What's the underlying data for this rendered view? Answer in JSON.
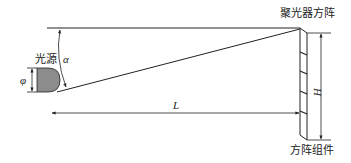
{
  "diagram": {
    "type": "optical-geometry",
    "labels": {
      "light_source": "光源",
      "concentrator_array": "聚光器方阵",
      "array_module": "方阵组件",
      "angle": "α",
      "diameter": "φ",
      "distance": "L",
      "height": "H"
    },
    "colors": {
      "line": "#222222",
      "source_fill": "#8c8c8c",
      "background": "#ffffff"
    }
  }
}
